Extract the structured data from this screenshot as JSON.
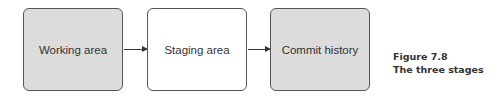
{
  "diagram": {
    "nodes": [
      {
        "id": "working",
        "label": "Working area",
        "fill": "#dcdcdc"
      },
      {
        "id": "staging",
        "label": "Staging area",
        "fill": "#ffffff"
      },
      {
        "id": "commit",
        "label": "Commit history",
        "fill": "#dcdcdc"
      }
    ],
    "edges": [
      {
        "from": "working",
        "to": "staging"
      },
      {
        "from": "staging",
        "to": "commit"
      }
    ]
  },
  "caption": {
    "number": "Figure 7.8",
    "title": "The three stages"
  }
}
